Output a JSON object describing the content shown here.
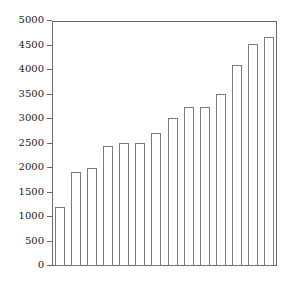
{
  "chart_data": {
    "type": "bar",
    "title": "",
    "subtitle": "",
    "xlabel": "",
    "ylabel": "",
    "categories": [
      "1",
      "2",
      "3",
      "4",
      "5",
      "6",
      "7",
      "8",
      "9",
      "10",
      "11",
      "12",
      "13",
      "14"
    ],
    "values": [
      1205,
      1920,
      2005,
      2440,
      2520,
      2520,
      2705,
      3015,
      3245,
      3250,
      3520,
      4095,
      4525,
      4665
    ],
    "series": [
      {
        "name": "",
        "values": [
          1205,
          1920,
          2005,
          2440,
          2520,
          2520,
          2705,
          3015,
          3245,
          3250,
          3520,
          4095,
          4525,
          4665
        ]
      }
    ],
    "ylim": [
      0,
      5000
    ],
    "yticks": [
      0,
      500,
      1000,
      1500,
      2000,
      2500,
      3000,
      3500,
      4000,
      4500,
      5000
    ],
    "ytick_labels": [
      "0",
      "500",
      "1000",
      "1500",
      "2000",
      "2500",
      "3000",
      "3500",
      "4000",
      "4500",
      "5000"
    ],
    "xticks": [],
    "xtick_labels": [],
    "grid": false,
    "legend": false,
    "legend_position": "none",
    "bar_fill_color": "#ffffff",
    "bar_edge_color": "#7a7a7a",
    "axis_color": "#6b6b6b",
    "background_color": "#ffffff",
    "text_color": "#1a1a1a"
  },
  "axis": {
    "y_max_label": "5000",
    "y_min_label": "0"
  }
}
